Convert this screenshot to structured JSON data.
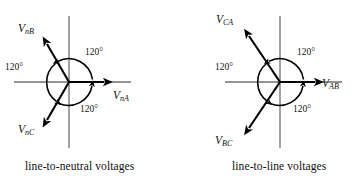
{
  "figure": {
    "background_color": "#ffffff",
    "axis_color": "#6f6f6f",
    "vector_color": "#000000"
  },
  "diagrams": [
    {
      "id": "line-to-neutral",
      "caption": "line-to-neutral voltages",
      "origin": {
        "x": 69,
        "y": 82
      },
      "vectors": [
        {
          "name": "V_nA",
          "label_v": "V",
          "label_sub": "nA",
          "angle_deg": 0,
          "length": 45
        },
        {
          "name": "V_nB",
          "label_v": "V",
          "label_sub": "nB",
          "angle_deg": 120,
          "length": 45
        },
        {
          "name": "V_nC",
          "label_v": "V",
          "label_sub": "nC",
          "angle_deg": -120,
          "length": 45
        }
      ],
      "angle_labels": [
        {
          "text": "120°",
          "between": "V_nA-V_nB"
        },
        {
          "text": "120°",
          "between": "V_nB-V_nC"
        },
        {
          "text": "120°",
          "between": "V_nC-V_nA"
        }
      ]
    },
    {
      "id": "line-to-line",
      "caption": "line-to-line voltages",
      "origin": {
        "x": 280,
        "y": 82
      },
      "vectors": [
        {
          "name": "V_AB",
          "label_v": "V",
          "label_sub": "AB",
          "angle_deg": 0,
          "length": 45
        },
        {
          "name": "V_CA",
          "label_v": "V",
          "label_sub": "CA",
          "angle_deg": 120,
          "length": 45
        },
        {
          "name": "V_BC",
          "label_v": "V",
          "label_sub": "BC",
          "angle_deg": -120,
          "length": 45
        }
      ],
      "angle_labels": [
        {
          "text": "120°",
          "between": "V_AB-V_CA"
        },
        {
          "text": "120°",
          "between": "V_CA-V_BC"
        },
        {
          "text": "120°",
          "between": "V_BC-V_AB"
        }
      ]
    }
  ],
  "labels": {
    "left": {
      "v_a": "V",
      "v_a_sub": "nA",
      "v_b": "V",
      "v_b_sub": "nB",
      "v_c": "V",
      "v_c_sub": "nC",
      "angle1": "120°",
      "angle2": "120°",
      "angle3": "120°",
      "caption": "line-to-neutral voltages"
    },
    "right": {
      "v_a": "V",
      "v_a_sub": "AB",
      "v_b": "V",
      "v_b_sub": "CA",
      "v_c": "V",
      "v_c_sub": "BC",
      "angle1": "120°",
      "angle2": "120°",
      "angle3": "120°",
      "caption": "line-to-line voltages"
    }
  }
}
